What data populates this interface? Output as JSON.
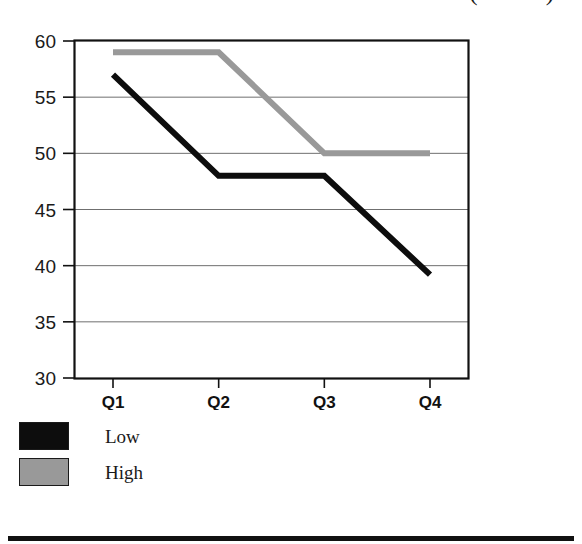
{
  "chart_data": {
    "type": "line",
    "title": "(dollars)",
    "xlabel": "",
    "ylabel": "",
    "categories": [
      "Q1",
      "Q2",
      "Q3",
      "Q4"
    ],
    "series": [
      {
        "name": "Low",
        "color": "#0d0d0d",
        "values": [
          57,
          48,
          48,
          39.2
        ]
      },
      {
        "name": "High",
        "color": "#999999",
        "values": [
          59,
          59,
          50,
          50
        ]
      }
    ],
    "ylim": [
      30,
      60
    ],
    "ytick_labels": [
      "60",
      "55",
      "50",
      "45",
      "40",
      "35",
      "30"
    ],
    "ytick_values": [
      60,
      55,
      50,
      45,
      40,
      35,
      30
    ],
    "grid": true,
    "legend_position": "below-left",
    "frame": true
  },
  "legend": {
    "items": [
      {
        "label": "Low",
        "color": "#0d0d0d"
      },
      {
        "label": "High",
        "color": "#999999"
      }
    ]
  }
}
